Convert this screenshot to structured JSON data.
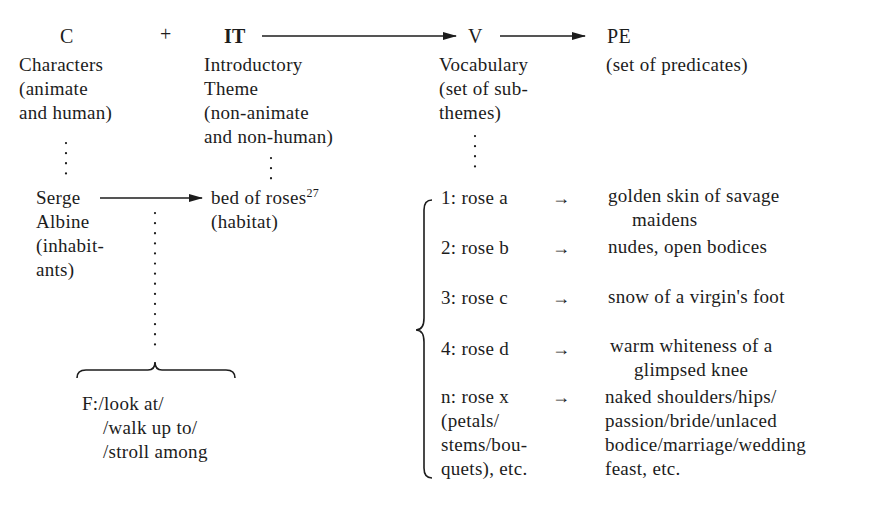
{
  "header": {
    "c": "C",
    "plus": "+",
    "it": "IT",
    "v": "V",
    "pe": "PE"
  },
  "descriptions": {
    "c": [
      "Characters",
      "(animate",
      "and human)"
    ],
    "it": [
      "Introductory",
      "Theme",
      "(non-animate",
      "and non-human)"
    ],
    "v": [
      "Vocabulary",
      "(set of sub-",
      "themes)"
    ],
    "pe": [
      "(set of predicates)"
    ]
  },
  "instances": {
    "serge": [
      "Serge",
      "Albine",
      "(inhabit-",
      "ants)"
    ],
    "bed": "bed of roses",
    "bed_footnote": "27",
    "habitat": "(habitat)"
  },
  "function": {
    "lines": [
      "F:/look at/",
      "/walk up to/",
      "/stroll among"
    ]
  },
  "vocabulary": [
    {
      "label": "1: rose a",
      "predicate": [
        "golden skin of savage",
        "maidens"
      ]
    },
    {
      "label": "2: rose b",
      "predicate": [
        "nudes, open bodices"
      ]
    },
    {
      "label": "3: rose c",
      "predicate": [
        "snow of a virgin's foot"
      ]
    },
    {
      "label": "4: rose d",
      "predicate": [
        "warm whiteness of a",
        "glimpsed knee"
      ]
    },
    {
      "label": "n: rose x",
      "label_extra": [
        "(petals/",
        "stems/bou-",
        "quets), etc."
      ],
      "predicate": [
        "naked shoulders/hips/",
        "passion/bride/unlaced",
        "bodice/marriage/wedding",
        "feast, etc."
      ]
    }
  ],
  "arrow_glyph": "→"
}
